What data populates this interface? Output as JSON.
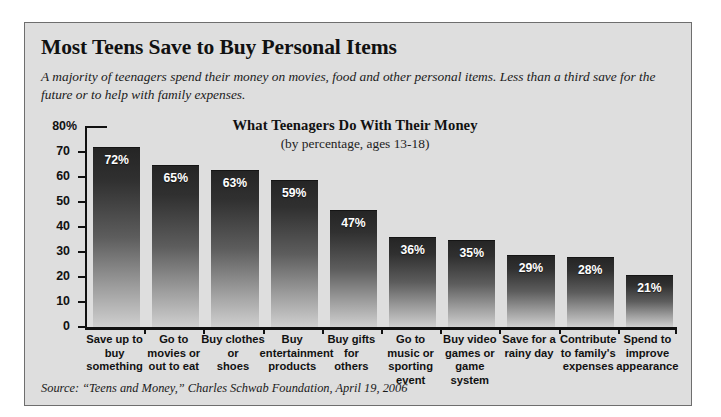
{
  "headline": "Most Teens Save to Buy Personal Items",
  "deck": "A majority of teenagers spend their money on movies, food and other personal items. Less than a third save for the future or to help with family expenses.",
  "source": "Source: “Teens and Money,” Charles Schwab Foundation, April 19, 2006",
  "chart_data": {
    "type": "bar",
    "title": "What Teenagers Do With Their Money",
    "subtitle": "(by percentage, ages 13-18)",
    "xlabel": "",
    "ylabel": "",
    "ylim": [
      0,
      80
    ],
    "grid": false,
    "legend": false,
    "yticks": [
      "0",
      "10",
      "20",
      "30",
      "40",
      "50",
      "60",
      "70",
      "80%"
    ],
    "ytick_values": [
      0,
      10,
      20,
      30,
      40,
      50,
      60,
      70,
      80
    ],
    "categories": [
      "Save up to buy something",
      "Go to movies or out to eat",
      "Buy clothes or shoes",
      "Buy entertainment products",
      "Buy gifts for others",
      "Go to music or sporting event",
      "Buy video games or game system",
      "Save for a rainy day",
      "Contribute to family's expenses",
      "Spend to improve appearance"
    ],
    "category_lines": [
      [
        "Save up to",
        "buy",
        "something"
      ],
      [
        "Go to",
        "movies or",
        "out to eat"
      ],
      [
        "Buy clothes",
        "or",
        "shoes"
      ],
      [
        "Buy",
        "entertainment",
        "products"
      ],
      [
        "Buy gifts",
        "for",
        "others"
      ],
      [
        "Go to",
        "music or",
        "sporting",
        "event"
      ],
      [
        "Buy video",
        "games or",
        "game system"
      ],
      [
        "Save for a",
        "rainy day"
      ],
      [
        "Contribute",
        "to family's",
        "expenses"
      ],
      [
        "Spend to",
        "improve",
        "appearance"
      ]
    ],
    "values": [
      72,
      65,
      63,
      59,
      47,
      36,
      35,
      29,
      28,
      21
    ],
    "value_labels": [
      "72%",
      "65%",
      "63%",
      "59%",
      "47%",
      "36%",
      "35%",
      "29%",
      "28%",
      "21%"
    ],
    "colors": {
      "bar_top": "#252525",
      "bar_bottom": "#cfcfcf",
      "panel_background": "#dedede",
      "page_background": "#ffffff",
      "axis": "#111111",
      "value_label": "#ffffff",
      "text": "#111111"
    }
  }
}
